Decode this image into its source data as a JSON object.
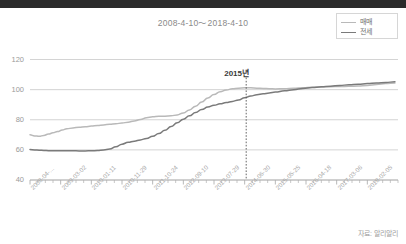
{
  "window": {
    "titlebar_text": ""
  },
  "chart_title": "2008-4-10〜2018-4-10",
  "legend": {
    "position": "top-right",
    "items": [
      {
        "label": "매매",
        "color": "#b9b9b9"
      },
      {
        "label": "전세",
        "color": "#7a7a7a"
      }
    ]
  },
  "annotation": {
    "label": "2015년",
    "x_value": "2015-01-01"
  },
  "source_note": "자료: 알리알리",
  "colors": {
    "maemae": "#b9b9b9",
    "jeonse": "#7a7a7a",
    "grid": "#c8c8c8",
    "axis": "#b0b0b0",
    "text": "#9a9a9a",
    "annotation": "#3a3a3a",
    "titlebar": "#2b2b2b"
  },
  "chart_data": {
    "type": "line",
    "title": "2008-4-10〜2018-4-10",
    "xlabel": "",
    "ylabel": "",
    "ylim": [
      40,
      125
    ],
    "yticks": [
      40,
      60,
      80,
      100,
      120
    ],
    "grid": true,
    "legend_position": "top-right",
    "x_tick_labels": [
      "2008-04-...",
      "2009-03-02",
      "2010-01-11",
      "2010-11-29",
      "2011-10-24",
      "2012-09-10",
      "2013-07-29",
      "2014-06-30",
      "2015-05-25",
      "2016-04-18",
      "2017-03-06",
      "2018-02-05"
    ],
    "x_tick_positions": [
      0,
      1,
      2,
      3,
      4,
      5,
      6,
      7,
      8,
      9,
      10,
      11
    ],
    "minor_ticks_per_major": 4,
    "series": [
      {
        "name": "매매",
        "color": "#b9b9b9",
        "x": [
          0.0,
          0.15,
          0.3,
          0.45,
          0.6,
          0.75,
          0.9,
          1.05,
          1.2,
          1.4,
          1.6,
          1.8,
          2.0,
          2.2,
          2.4,
          2.6,
          2.8,
          3.0,
          3.2,
          3.4,
          3.6,
          3.8,
          4.0,
          4.2,
          4.4,
          4.6,
          4.8,
          5.0,
          5.2,
          5.4,
          5.6,
          5.8,
          6.0,
          6.2,
          6.4,
          6.6,
          6.8,
          7.0,
          7.2,
          7.4,
          7.6,
          7.8,
          8.0,
          8.3,
          8.6,
          8.9,
          9.2,
          9.5,
          9.8,
          10.1,
          10.4,
          10.7,
          11.0,
          11.3,
          11.6,
          11.9
        ],
        "y": [
          70.0,
          69.3,
          69.0,
          69.6,
          70.5,
          71.3,
          72.2,
          73.2,
          74.0,
          74.6,
          75.0,
          75.4,
          75.8,
          76.2,
          76.6,
          77.0,
          77.4,
          77.8,
          78.4,
          79.2,
          80.2,
          81.4,
          82.0,
          82.3,
          82.4,
          82.6,
          83.2,
          84.5,
          86.5,
          89.0,
          91.8,
          94.5,
          96.8,
          98.6,
          99.8,
          100.6,
          101.0,
          101.2,
          101.2,
          101.0,
          100.8,
          100.6,
          100.5,
          100.6,
          100.9,
          101.3,
          101.6,
          101.8,
          102.0,
          102.1,
          102.2,
          102.4,
          102.8,
          103.4,
          104.0,
          104.4
        ]
      },
      {
        "name": "전세",
        "color": "#7a7a7a",
        "x": [
          0.0,
          0.15,
          0.3,
          0.45,
          0.6,
          0.75,
          0.9,
          1.05,
          1.2,
          1.4,
          1.6,
          1.8,
          2.0,
          2.2,
          2.4,
          2.6,
          2.8,
          3.0,
          3.2,
          3.4,
          3.6,
          3.8,
          4.0,
          4.2,
          4.4,
          4.6,
          4.8,
          5.0,
          5.2,
          5.4,
          5.6,
          5.8,
          6.0,
          6.2,
          6.4,
          6.6,
          6.8,
          7.0,
          7.2,
          7.4,
          7.6,
          7.8,
          8.0,
          8.3,
          8.6,
          8.9,
          9.2,
          9.5,
          9.8,
          10.1,
          10.4,
          10.7,
          11.0,
          11.3,
          11.6,
          11.9
        ],
        "y": [
          60.2,
          60.0,
          59.8,
          59.6,
          59.5,
          59.4,
          59.4,
          59.5,
          59.5,
          59.4,
          59.3,
          59.3,
          59.4,
          59.6,
          60.0,
          60.6,
          62.0,
          63.8,
          65.0,
          65.8,
          66.6,
          67.6,
          69.0,
          70.8,
          73.0,
          75.5,
          78.0,
          80.4,
          82.6,
          84.8,
          86.8,
          88.4,
          89.6,
          90.6,
          91.4,
          92.2,
          93.2,
          94.6,
          95.8,
          96.6,
          97.2,
          97.8,
          98.4,
          99.2,
          100.0,
          100.8,
          101.4,
          101.9,
          102.3,
          102.8,
          103.2,
          103.6,
          104.0,
          104.4,
          104.8,
          105.2
        ]
      }
    ]
  },
  "plot_geometry": {
    "left": 30,
    "right": 398,
    "top": 52,
    "bottom": 180
  }
}
